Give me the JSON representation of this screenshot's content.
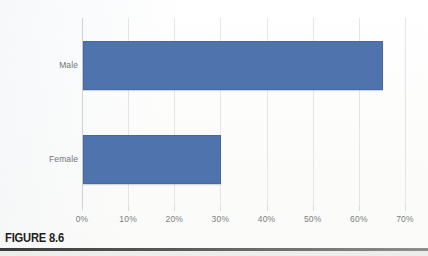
{
  "figure": {
    "caption": "FIGURE 8.6"
  },
  "chart_data": {
    "type": "bar",
    "orientation": "horizontal",
    "title": "",
    "xlabel": "",
    "ylabel": "",
    "categories": [
      "Male",
      "Female"
    ],
    "values": [
      65,
      30
    ],
    "value_suffix": "%",
    "xlim": [
      0,
      70
    ],
    "xticks": [
      0,
      10,
      20,
      30,
      40,
      50,
      60,
      70
    ],
    "xtick_labels": [
      "0%",
      "10%",
      "20%",
      "30%",
      "40%",
      "50%",
      "60%",
      "70%"
    ],
    "grid": true,
    "grid_axis": "x",
    "legend": false,
    "legend_position": "none",
    "series": [
      {
        "name": "",
        "color": "#4e73ad",
        "values": [
          65,
          30
        ]
      }
    ]
  },
  "colors": {
    "bar_fill": "#4e73ad",
    "bar_border": "#46689e",
    "gridline": "#e3e6e9",
    "axis": "#cdd1d5",
    "tick_label": "#7b7f84",
    "category_label": "#6f7479",
    "caption_text": "#1e1e1e",
    "background": "#fdfdfc"
  }
}
